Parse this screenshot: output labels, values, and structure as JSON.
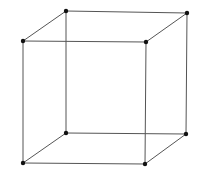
{
  "diagram": {
    "title": "",
    "type": "wireframe-cube",
    "background": "#ffffff",
    "edge_color": "#555555",
    "vertex_color": "#111111",
    "edge_width": 1,
    "vertex_radius": 2.2,
    "vertices": [
      {
        "id": "front-top-left",
        "x": 23,
        "y": 41
      },
      {
        "id": "front-top-right",
        "x": 146,
        "y": 42
      },
      {
        "id": "front-bottom-left",
        "x": 23,
        "y": 163
      },
      {
        "id": "front-bottom-right",
        "x": 145,
        "y": 164
      },
      {
        "id": "back-top-left",
        "x": 66,
        "y": 11
      },
      {
        "id": "back-top-right",
        "x": 187,
        "y": 13
      },
      {
        "id": "back-bottom-left",
        "x": 66,
        "y": 133
      },
      {
        "id": "back-bottom-right",
        "x": 186,
        "y": 134
      }
    ],
    "edges": [
      [
        "front-top-left",
        "front-top-right"
      ],
      [
        "front-top-right",
        "front-bottom-right"
      ],
      [
        "front-bottom-right",
        "front-bottom-left"
      ],
      [
        "front-bottom-left",
        "front-top-left"
      ],
      [
        "back-top-left",
        "back-top-right"
      ],
      [
        "back-top-right",
        "back-bottom-right"
      ],
      [
        "back-bottom-right",
        "back-bottom-left"
      ],
      [
        "back-bottom-left",
        "back-top-left"
      ],
      [
        "front-top-left",
        "back-top-left"
      ],
      [
        "front-top-right",
        "back-top-right"
      ],
      [
        "front-bottom-left",
        "back-bottom-left"
      ],
      [
        "front-bottom-right",
        "back-bottom-right"
      ]
    ]
  }
}
